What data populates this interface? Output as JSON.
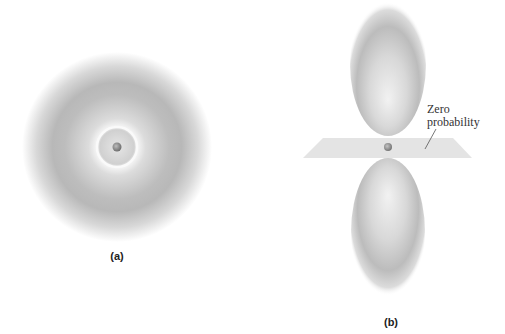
{
  "figure": {
    "panels": [
      {
        "id": "a",
        "caption": "(a)",
        "description": "spherical orbital with radial node (2s-like)",
        "center": [
          117,
          147
        ],
        "outer_radius": 95,
        "node_ring_radius": 20,
        "nucleus_radius": 4
      },
      {
        "id": "b",
        "caption": "(b)",
        "description": "dumbbell orbital with nodal plane (2p-like)",
        "center": [
          388,
          147
        ],
        "annotation": "Zero probability",
        "annotation_lines": [
          "Zero",
          "probability"
        ]
      }
    ],
    "colors": {
      "cloud": "#8a8a8a",
      "plane": "#e4e4e4",
      "nucleus": "#8c8c8c",
      "text": "#333333"
    }
  }
}
